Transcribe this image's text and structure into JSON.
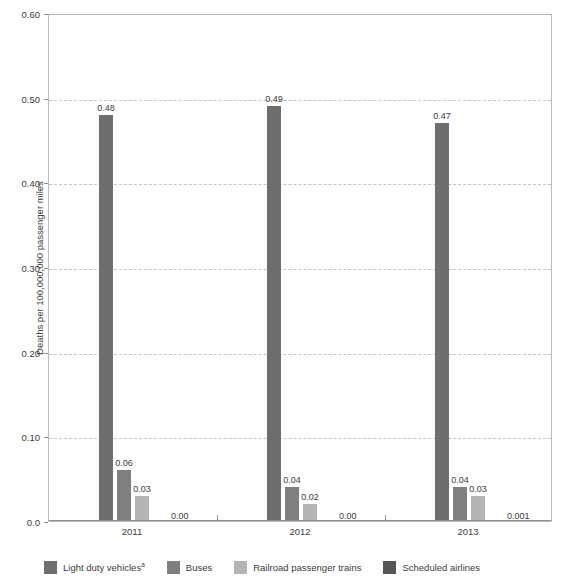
{
  "chart_data": {
    "type": "bar",
    "title": "",
    "subtitle": "",
    "xlabel": "",
    "ylabel": "Deaths per 100,000,000 passenger miles",
    "categories": [
      "2011",
      "2012",
      "2013"
    ],
    "ylim": [
      0.0,
      0.6
    ],
    "ytick_values": [
      0.0,
      0.1,
      0.2,
      0.3,
      0.4,
      0.5,
      0.6
    ],
    "ytick_labels": [
      "0.0",
      "0.10",
      "0.20",
      "0.30",
      "0.40",
      "0.50",
      "0.60"
    ],
    "grid": "horizontal-dashed",
    "legend_position": "bottom",
    "series": [
      {
        "name": "Light duty vehicles",
        "footnote_marker": "a",
        "color": "#6e6e6e",
        "values": [
          0.48,
          0.49,
          0.47
        ],
        "labels": [
          "0.48",
          "0.49",
          "0.47"
        ]
      },
      {
        "name": "Buses",
        "footnote_marker": "",
        "color": "#7f7f7f",
        "values": [
          0.06,
          0.04,
          0.04
        ],
        "labels": [
          "0.06",
          "0.04",
          "0.04"
        ]
      },
      {
        "name": "Railroad passenger trains",
        "footnote_marker": "",
        "color": "#b4b4b4",
        "values": [
          0.03,
          0.02,
          0.03
        ],
        "labels": [
          "0.03",
          "0.02",
          "0.03"
        ]
      },
      {
        "name": "Scheduled airlines",
        "footnote_marker": "",
        "color": "#555555",
        "values": [
          0.0,
          0.0,
          0.001
        ],
        "labels": [
          "0.00",
          "0.00",
          "0.001"
        ]
      }
    ]
  },
  "legend": {
    "items": [
      {
        "label": "Light duty vehicles",
        "marker": "a",
        "color": "#6e6e6e"
      },
      {
        "label": "Buses",
        "marker": "",
        "color": "#7f7f7f"
      },
      {
        "label": "Railroad passenger trains",
        "marker": "",
        "color": "#b4b4b4"
      },
      {
        "label": "Scheduled airlines",
        "marker": "",
        "color": "#555555"
      }
    ]
  }
}
